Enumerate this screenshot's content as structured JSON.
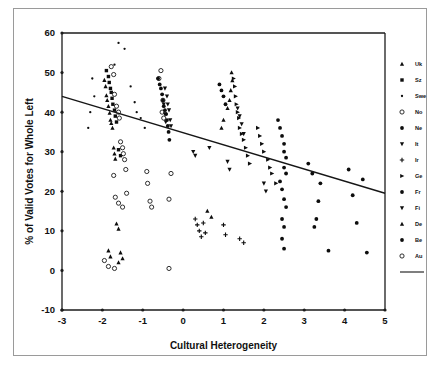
{
  "figure": {
    "background_color": "#ffffff",
    "frame_color": "#9a9a9a",
    "axis_color": "#1c1c1c"
  },
  "chart_data": {
    "type": "scatter",
    "title": "",
    "xlabel": "Cultural Heterogeneity",
    "ylabel": "% of Valid Votes for Whole Left",
    "xlim": [
      -3,
      5
    ],
    "ylim": [
      -10,
      60
    ],
    "xticks": [
      -3,
      -2,
      -1,
      0,
      1,
      2,
      3,
      4,
      5
    ],
    "xticklabels": [
      "-3",
      "-2",
      "-1",
      "0",
      "1",
      "2",
      "3",
      "4",
      "5"
    ],
    "yticks": [
      -10,
      0,
      10,
      20,
      30,
      40,
      50,
      60
    ],
    "yticklabels": [
      "-10",
      "0",
      "10",
      "20",
      "30",
      "40",
      "50",
      "60"
    ],
    "grid": false,
    "legend_position": "right",
    "legend_title": "",
    "trendline": {
      "label": "regression line",
      "x_start": -3,
      "y_start": 44.0,
      "x_end": 5,
      "y_end": 19.5,
      "slope": -3.06,
      "intercept": 34.8
    },
    "legend": [
      {
        "label": "Uk",
        "marker": "triangle-up-small"
      },
      {
        "label": "Sz",
        "marker": "square-small"
      },
      {
        "label": "Swe",
        "marker": "dot-tiny"
      },
      {
        "label": "No",
        "marker": "circle-open"
      },
      {
        "label": "Ne",
        "marker": "circle-filled"
      },
      {
        "label": "It",
        "marker": "triangle-down-small"
      },
      {
        "label": "Ir",
        "marker": "plus-small"
      },
      {
        "label": "Ge",
        "marker": "triangle-right"
      },
      {
        "label": "Fr",
        "marker": "circle-filled"
      },
      {
        "label": "Fi",
        "marker": "triangle-down"
      },
      {
        "label": "De",
        "marker": "triangle-up"
      },
      {
        "label": "Be",
        "marker": "circle-filled"
      },
      {
        "label": "Au",
        "marker": "circle-open"
      }
    ],
    "series": [
      {
        "name": "Uk",
        "marker": "triangle-up-small",
        "points": [
          [
            -1.95,
            48.1
          ],
          [
            -1.92,
            46.5
          ],
          [
            -1.9,
            44.2
          ],
          [
            -1.88,
            43.0
          ],
          [
            -1.85,
            41.5
          ],
          [
            -1.82,
            39.8
          ],
          [
            -1.8,
            38.0
          ],
          [
            -1.78,
            37.2
          ],
          [
            -1.75,
            36.0
          ],
          [
            -1.72,
            31.0
          ],
          [
            -1.7,
            29.5
          ],
          [
            -1.68,
            28.2
          ],
          [
            -1.65,
            11.8
          ],
          [
            -1.6,
            10.5
          ],
          [
            -1.55,
            4.5
          ],
          [
            -1.5,
            3.0
          ]
        ]
      },
      {
        "name": "Sz",
        "marker": "square-small",
        "points": [
          [
            -1.9,
            50.5
          ],
          [
            -1.85,
            49.0
          ],
          [
            -1.83,
            47.5
          ],
          [
            -1.8,
            46.0
          ],
          [
            -1.78,
            45.0
          ],
          [
            -1.76,
            43.5
          ],
          [
            -1.74,
            42.0
          ],
          [
            -1.7,
            40.5
          ],
          [
            -1.68,
            39.0
          ],
          [
            -1.65,
            37.5
          ],
          [
            -1.6,
            30.5
          ],
          [
            -1.55,
            29.0
          ]
        ]
      },
      {
        "name": "Swe",
        "marker": "dot-tiny",
        "points": [
          [
            -1.6,
            57.5
          ],
          [
            -1.45,
            56.0
          ],
          [
            -1.7,
            52.0
          ],
          [
            -2.25,
            48.5
          ],
          [
            -2.2,
            44.0
          ],
          [
            -2.3,
            40.0
          ],
          [
            -2.35,
            36.0
          ],
          [
            -1.3,
            46.5
          ],
          [
            -1.2,
            42.5
          ],
          [
            -1.15,
            40.0
          ],
          [
            -1.05,
            38.5
          ],
          [
            -0.95,
            36.0
          ]
        ]
      },
      {
        "name": "No",
        "marker": "circle-open",
        "points": [
          [
            -1.78,
            51.5
          ],
          [
            -1.72,
            49.5
          ],
          [
            -1.7,
            44.5
          ],
          [
            -1.65,
            41.5
          ],
          [
            -1.6,
            40.0
          ],
          [
            -1.58,
            38.5
          ],
          [
            -1.55,
            32.5
          ],
          [
            -1.5,
            31.0
          ],
          [
            -1.48,
            29.5
          ],
          [
            -1.45,
            28.0
          ],
          [
            -1.42,
            25.5
          ],
          [
            -1.4,
            19.5
          ],
          [
            -0.55,
            50.5
          ],
          [
            -0.6,
            48.5
          ],
          [
            -0.5,
            43.0
          ],
          [
            -0.52,
            40.0
          ],
          [
            -0.48,
            38.5
          ],
          [
            -0.3,
            24.5
          ],
          [
            -0.35,
            18.0
          ]
        ]
      },
      {
        "name": "Ne",
        "marker": "circle-filled",
        "points": [
          [
            -0.62,
            48.5
          ],
          [
            -0.58,
            47.0
          ],
          [
            -0.55,
            46.0
          ],
          [
            -0.52,
            44.5
          ],
          [
            -0.5,
            43.0
          ],
          [
            -0.48,
            41.5
          ],
          [
            -0.45,
            40.5
          ],
          [
            -0.42,
            39.5
          ],
          [
            -0.4,
            38.0
          ],
          [
            -0.38,
            36.5
          ],
          [
            -0.36,
            35.0
          ],
          [
            -0.34,
            33.0
          ],
          [
            0.9,
            47.0
          ],
          [
            0.95,
            45.5
          ],
          [
            1.0,
            44.0
          ],
          [
            1.05,
            42.0
          ]
        ]
      },
      {
        "name": "It",
        "marker": "triangle-down-small",
        "points": [
          [
            -0.45,
            46.0
          ],
          [
            -0.4,
            44.0
          ],
          [
            -0.38,
            42.0
          ],
          [
            -0.35,
            40.5
          ],
          [
            -0.32,
            38.0
          ],
          [
            -0.3,
            36.5
          ],
          [
            0.25,
            30.0
          ],
          [
            0.3,
            29.0
          ],
          [
            1.35,
            41.0
          ],
          [
            1.4,
            39.0
          ],
          [
            1.45,
            37.0
          ],
          [
            1.5,
            34.5
          ]
        ]
      },
      {
        "name": "Ir",
        "marker": "plus-small",
        "points": [
          [
            0.3,
            13.0
          ],
          [
            0.35,
            11.5
          ],
          [
            0.4,
            10.0
          ],
          [
            0.45,
            8.5
          ],
          [
            0.5,
            12.0
          ],
          [
            0.55,
            9.5
          ],
          [
            1.0,
            11.5
          ],
          [
            1.05,
            9.0
          ],
          [
            1.4,
            8.0
          ],
          [
            1.5,
            7.0
          ]
        ]
      },
      {
        "name": "Ge",
        "marker": "triangle-right",
        "points": [
          [
            1.25,
            48.5
          ],
          [
            1.28,
            46.5
          ],
          [
            1.3,
            44.0
          ],
          [
            1.32,
            42.0
          ],
          [
            1.35,
            40.0
          ],
          [
            1.38,
            38.5
          ],
          [
            1.4,
            36.0
          ],
          [
            1.45,
            34.5
          ],
          [
            1.5,
            33.0
          ],
          [
            1.55,
            31.0
          ],
          [
            1.6,
            29.0
          ],
          [
            1.65,
            27.0
          ],
          [
            1.85,
            36.0
          ],
          [
            1.9,
            34.0
          ],
          [
            1.95,
            32.0
          ],
          [
            2.0,
            30.0
          ],
          [
            2.1,
            28.0
          ],
          [
            2.15,
            26.0
          ],
          [
            2.2,
            24.5
          ],
          [
            2.3,
            22.0
          ]
        ]
      },
      {
        "name": "Fr",
        "marker": "circle-filled",
        "points": [
          [
            2.35,
            38.0
          ],
          [
            2.4,
            36.0
          ],
          [
            2.45,
            34.0
          ],
          [
            2.5,
            32.0
          ],
          [
            2.5,
            30.0
          ],
          [
            2.55,
            28.5
          ],
          [
            2.5,
            26.0
          ],
          [
            2.55,
            24.5
          ],
          [
            2.4,
            22.5
          ],
          [
            2.45,
            20.5
          ],
          [
            2.5,
            18.0
          ],
          [
            2.55,
            16.0
          ],
          [
            2.45,
            13.0
          ],
          [
            2.5,
            11.0
          ],
          [
            2.45,
            8.0
          ],
          [
            2.5,
            5.5
          ]
        ]
      },
      {
        "name": "Fi",
        "marker": "triangle-down",
        "points": [
          [
            -0.48,
            42.0
          ],
          [
            -0.45,
            39.5
          ],
          [
            -0.43,
            37.5
          ],
          [
            0.65,
            31.0
          ],
          [
            1.1,
            27.5
          ],
          [
            1.15,
            25.5
          ],
          [
            2.0,
            22.0
          ],
          [
            2.05,
            20.0
          ]
        ]
      },
      {
        "name": "De",
        "marker": "triangle-up",
        "points": [
          [
            1.2,
            50.0
          ],
          [
            1.22,
            48.0
          ],
          [
            1.18,
            45.5
          ],
          [
            1.15,
            43.0
          ],
          [
            1.1,
            41.0
          ],
          [
            1.0,
            38.0
          ],
          [
            0.95,
            36.0
          ],
          [
            0.6,
            15.0
          ],
          [
            0.7,
            13.5
          ],
          [
            -1.85,
            5.0
          ],
          [
            -1.8,
            3.5
          ],
          [
            -1.6,
            2.0
          ]
        ]
      },
      {
        "name": "Be",
        "marker": "circle-filled",
        "points": [
          [
            3.1,
            27.0
          ],
          [
            3.2,
            24.5
          ],
          [
            3.4,
            22.0
          ],
          [
            3.35,
            17.5
          ],
          [
            3.3,
            13.0
          ],
          [
            3.25,
            11.0
          ],
          [
            3.6,
            5.0
          ],
          [
            4.1,
            25.5
          ],
          [
            4.45,
            23.0
          ],
          [
            4.2,
            19.0
          ],
          [
            4.55,
            4.5
          ],
          [
            4.3,
            12.0
          ]
        ]
      },
      {
        "name": "Au",
        "marker": "circle-open",
        "points": [
          [
            -1.72,
            24.0
          ],
          [
            -1.68,
            18.5
          ],
          [
            -1.6,
            17.0
          ],
          [
            -1.5,
            16.0
          ],
          [
            -0.82,
            17.5
          ],
          [
            -0.78,
            16.0
          ],
          [
            -1.95,
            2.5
          ],
          [
            -1.85,
            1.0
          ],
          [
            -1.7,
            0.5
          ],
          [
            -0.35,
            0.5
          ],
          [
            -0.9,
            25.0
          ],
          [
            -0.88,
            22.0
          ]
        ]
      }
    ]
  }
}
